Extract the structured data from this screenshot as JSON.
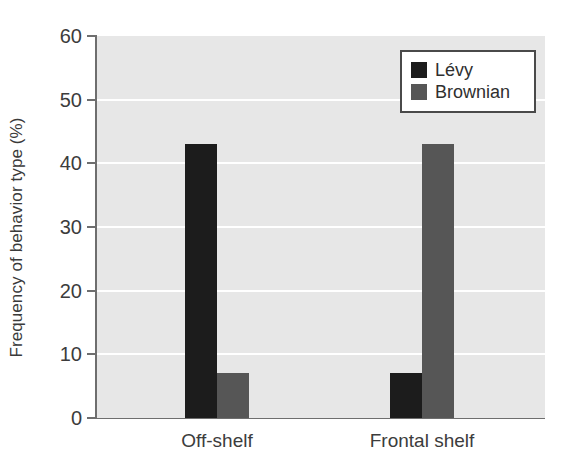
{
  "chart_data": {
    "type": "bar",
    "title": "",
    "xlabel": "",
    "ylabel": "Frequency of behavior type (%)",
    "categories": [
      "Off-shelf",
      "Frontal shelf"
    ],
    "series": [
      {
        "name": "Lévy",
        "color": "#1c1c1c",
        "values": [
          43,
          7
        ]
      },
      {
        "name": "Brownian",
        "color": "#565656",
        "values": [
          7,
          43
        ]
      }
    ],
    "ylim": [
      0,
      60
    ],
    "yticks": [
      0,
      10,
      20,
      30,
      40,
      50,
      60
    ],
    "ytick_labels": [
      "0",
      "10",
      "20",
      "30",
      "40",
      "50",
      "60"
    ],
    "grid": true,
    "grid_axis": "y",
    "grid_color": "#ffffff",
    "plot_background": "#e7e7e7",
    "legend": {
      "position": "upper right",
      "entries": [
        {
          "label": "Lévy",
          "color": "#1c1c1c"
        },
        {
          "label": "Brownian",
          "color": "#565656"
        }
      ]
    }
  }
}
